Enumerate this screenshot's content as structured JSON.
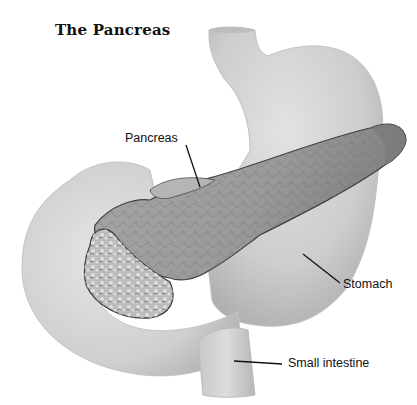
{
  "title": "The Pancreas",
  "labels": {
    "pancreas": "Pancreas",
    "stomach": "Stomach",
    "small_intestine": "Small intestine"
  },
  "colors": {
    "organ_light": "#d4d4d4",
    "organ_mid": "#bdbdbd",
    "pancreas_fill": "#9a9a9a",
    "pancreas_head": "#b8b8b8",
    "outline": "#3a3a3a",
    "leader_line": "#111111"
  }
}
